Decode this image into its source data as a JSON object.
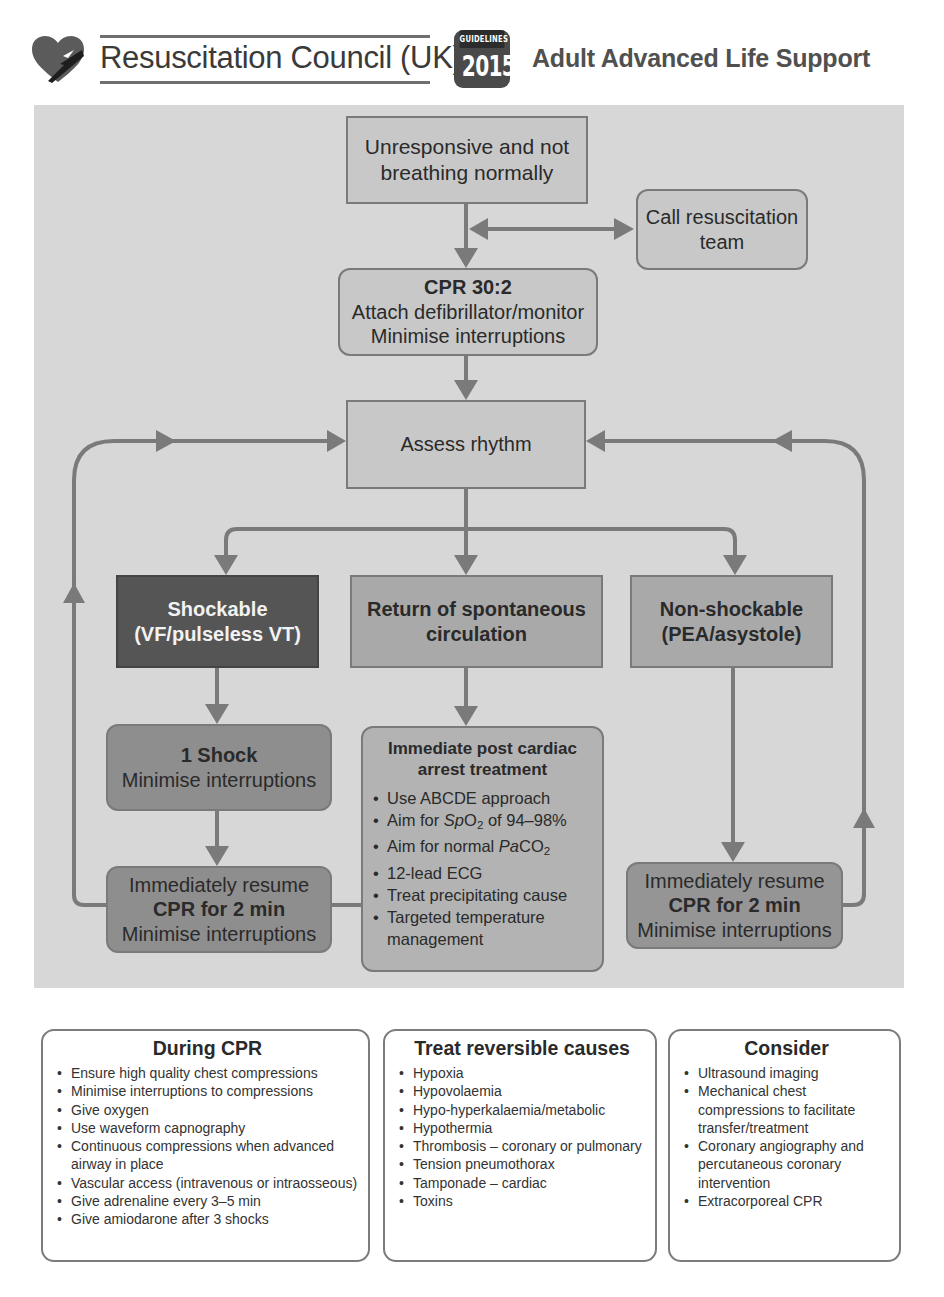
{
  "header": {
    "organization": "Resuscitation Council (UK)",
    "badge_top": "GUIDELINES",
    "badge_year": "2015",
    "title": "Adult Advanced Life Support",
    "logo_icon": "heart-with-lightning-icon"
  },
  "colors": {
    "panel_background": "#d7d7d7",
    "light_box": "#c8c8c8",
    "mid_box": "#a9a9a9",
    "dark_box": "#555555",
    "arrow": "#7a7a7a"
  },
  "flowchart": {
    "start": {
      "line1": "Unresponsive and not",
      "line2": "breathing normally"
    },
    "call_team": {
      "line1": "Call resuscitation",
      "line2": "team"
    },
    "cpr": {
      "title": "CPR 30:2",
      "line1": "Attach defibrillator/monitor",
      "line2": "Minimise interruptions"
    },
    "assess": {
      "label": "Assess rhythm"
    },
    "shockable": {
      "line1": "Shockable",
      "line2": "(VF/pulseless VT)"
    },
    "rosc": {
      "line1": "Return of spontaneous",
      "line2": "circulation"
    },
    "non_shockable": {
      "line1": "Non-shockable",
      "line2": "(PEA/asystole)"
    },
    "one_shock": {
      "title": "1 Shock",
      "line1": "Minimise interruptions"
    },
    "resume_left": {
      "line1": "Immediately resume",
      "title": "CPR for 2 min",
      "line2": "Minimise interruptions"
    },
    "resume_right": {
      "line1": "Immediately resume",
      "title": "CPR for 2 min",
      "line2": "Minimise interruptions"
    },
    "post_arrest": {
      "title_line1": "Immediate post cardiac",
      "title_line2": "arrest treatment",
      "items": {
        "abcde": "Use ABCDE approach",
        "spo2_pre": "Aim for ",
        "spo2_var": "Sp",
        "spo2_o": "O",
        "spo2_sub": "2",
        "spo2_post": " of 94–98%",
        "paco2_pre": "Aim for normal ",
        "paco2_var": "Pa",
        "paco2_co": "CO",
        "paco2_sub": "2",
        "ecg": "12-lead ECG",
        "cause": "Treat precipitating cause",
        "temp_line1": "Targeted temperature",
        "temp_line2": "management"
      }
    }
  },
  "cards": {
    "during_cpr": {
      "title": "During CPR",
      "items": [
        "Ensure high quality chest compressions",
        "Minimise interruptions to compressions",
        "Give oxygen",
        "Use waveform capnography",
        "Continuous compressions when advanced airway in place",
        "Vascular access (intravenous or intraosseous)",
        "Give adrenaline every 3–5 min",
        "Give amiodarone after 3 shocks"
      ]
    },
    "reversible_causes": {
      "title": "Treat reversible causes",
      "items": [
        "Hypoxia",
        "Hypovolaemia",
        "Hypo-hyperkalaemia/metabolic",
        "Hypothermia",
        "Thrombosis – coronary or pulmonary",
        "Tension pneumothorax",
        "Tamponade – cardiac",
        "Toxins"
      ]
    },
    "consider": {
      "title": "Consider",
      "items": [
        "Ultrasound imaging",
        "Mechanical chest compressions to facilitate transfer/treatment",
        "Coronary angiography and percutaneous coronary intervention",
        "Extracorporeal CPR"
      ]
    }
  }
}
